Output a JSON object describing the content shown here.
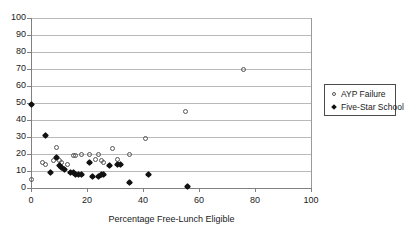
{
  "chart_data": {
    "type": "scatter",
    "title": "",
    "xlabel": "Percentage Free-Lunch Eligible",
    "ylabel": "",
    "xlim": [
      0,
      100
    ],
    "ylim": [
      0,
      100
    ],
    "xticks": [
      0,
      20,
      40,
      60,
      80,
      100
    ],
    "yticks": [
      0,
      10,
      20,
      30,
      40,
      50,
      60,
      70,
      80,
      90,
      100
    ],
    "grid": "horizontal",
    "legend_position": "right",
    "series": [
      {
        "name": "AYP Failure",
        "marker": "open-circle",
        "color": "#565656",
        "points": [
          [
            0,
            5
          ],
          [
            4,
            15
          ],
          [
            5,
            14
          ],
          [
            8,
            16
          ],
          [
            9,
            24
          ],
          [
            10,
            16
          ],
          [
            11,
            15
          ],
          [
            13,
            14
          ],
          [
            15,
            19
          ],
          [
            16,
            19
          ],
          [
            18,
            20
          ],
          [
            21,
            20
          ],
          [
            23,
            17
          ],
          [
            24,
            20
          ],
          [
            25,
            16
          ],
          [
            26,
            15
          ],
          [
            29,
            23
          ],
          [
            31,
            17
          ],
          [
            35,
            20
          ],
          [
            41,
            29
          ],
          [
            55,
            45
          ],
          [
            76,
            70
          ]
        ]
      },
      {
        "name": "Five-Star School",
        "marker": "filled-diamond",
        "color": "#111111",
        "points": [
          [
            0,
            49
          ],
          [
            5,
            31
          ],
          [
            7,
            9
          ],
          [
            9,
            18
          ],
          [
            10,
            13
          ],
          [
            11,
            12
          ],
          [
            12,
            11
          ],
          [
            14,
            9
          ],
          [
            15,
            9
          ],
          [
            16,
            8
          ],
          [
            17,
            8
          ],
          [
            18,
            8
          ],
          [
            21,
            15
          ],
          [
            22,
            7
          ],
          [
            24,
            7
          ],
          [
            25,
            8
          ],
          [
            26,
            8
          ],
          [
            28,
            13
          ],
          [
            31,
            14
          ],
          [
            32,
            14
          ],
          [
            35,
            3
          ],
          [
            42,
            8
          ],
          [
            56,
            1
          ]
        ]
      }
    ]
  },
  "legend": {
    "entries": [
      {
        "label": "AYP Failure"
      },
      {
        "label": "Five-Star School"
      }
    ]
  }
}
